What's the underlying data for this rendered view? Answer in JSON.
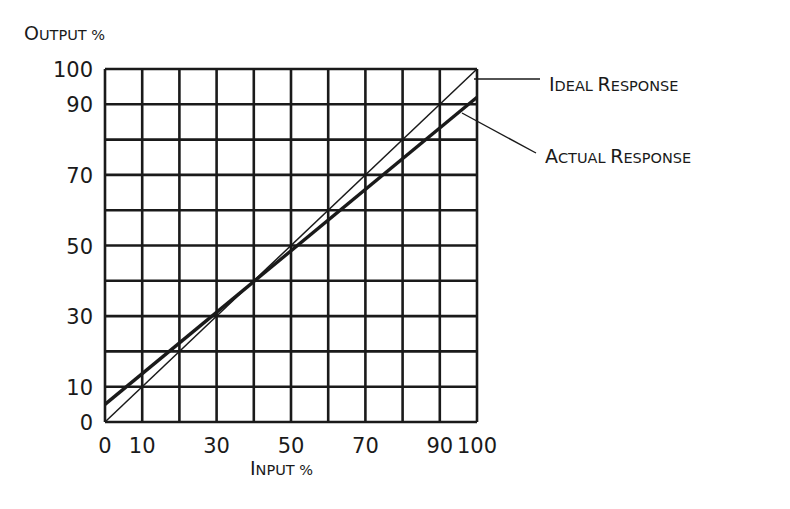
{
  "chart_data": {
    "type": "line",
    "title": "",
    "ylabel": "Output %",
    "xlabel": "Input %",
    "xlim": [
      0,
      100
    ],
    "ylim": [
      0,
      100
    ],
    "grid": true,
    "grid_step": 10,
    "x_tick_labels": [
      "0",
      "10",
      "30",
      "50",
      "70",
      "90",
      "100"
    ],
    "x_ticks": [
      0,
      10,
      30,
      50,
      70,
      90,
      100
    ],
    "y_tick_labels": [
      "0",
      "10",
      "30",
      "50",
      "70",
      "90",
      "100"
    ],
    "y_ticks": [
      0,
      10,
      30,
      50,
      70,
      90,
      100
    ],
    "series": [
      {
        "name": "Ideal Response",
        "x": [
          0,
          100
        ],
        "values": [
          0,
          100
        ],
        "style": "thin"
      },
      {
        "name": "Actual Response",
        "x": [
          0,
          100
        ],
        "values": [
          5,
          92
        ],
        "style": "thick"
      }
    ],
    "legend_position": "right, annotated with leader lines",
    "annotations": [
      {
        "text": "Ideal Response",
        "target_series": "Ideal Response"
      },
      {
        "text": "Actual Response",
        "target_series": "Actual Response"
      }
    ]
  },
  "labels": {
    "y_axis": {
      "first": "O",
      "rest": "UTPUT",
      "suffix": " %"
    },
    "x_axis": {
      "first": "I",
      "rest": "NPUT",
      "suffix": " %"
    },
    "ideal": {
      "w1_first": "I",
      "w1_rest": "DEAL",
      "w2_first": "R",
      "w2_rest": "ESPONSE"
    },
    "actual": {
      "w1_first": "A",
      "w1_rest": "CTUAL",
      "w2_first": "R",
      "w2_rest": "ESPONSE"
    }
  },
  "colors": {
    "ink": "#1a1a1a",
    "background": "#ffffff"
  }
}
